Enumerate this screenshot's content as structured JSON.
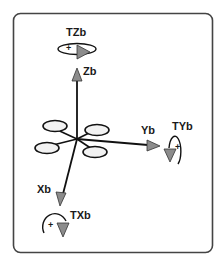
{
  "diagram": {
    "type": "quadcopter-body-frame",
    "colors": {
      "frame": "#444444",
      "axis": "#111111",
      "arrowhead_fill": "#8c8c8c",
      "rotor_fill": "#f2f2f2",
      "text": "#1a1a1a",
      "background": "#ffffff"
    },
    "axes": [
      {
        "name": "Zb",
        "label": "Zb",
        "direction": "up"
      },
      {
        "name": "Yb",
        "label": "Yb",
        "direction": "right"
      },
      {
        "name": "Xb",
        "label": "Xb",
        "direction": "down-left"
      }
    ],
    "torques": [
      {
        "name": "TZb",
        "label": "TZb",
        "sign": "+"
      },
      {
        "name": "TYb",
        "label": "TYb",
        "sign": "+"
      },
      {
        "name": "TXb",
        "label": "TXb",
        "sign": "+"
      }
    ],
    "rotor_count": 4
  }
}
